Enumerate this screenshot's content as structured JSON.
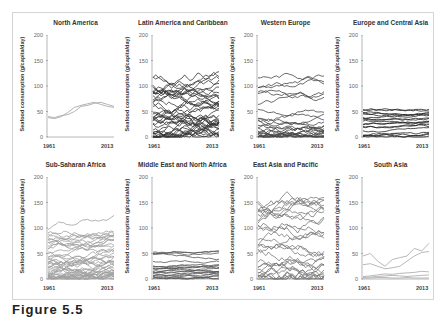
{
  "figure": {
    "caption": "Figure 5.5"
  },
  "chart_data": [
    {
      "type": "line",
      "title": "North America",
      "ylabel": "Seafood consumption (g/capita/day)",
      "xlabel": "",
      "x_ticks": [
        "1961",
        "2013"
      ],
      "y_ticks": [
        0,
        50,
        100,
        150,
        200
      ],
      "ylim": [
        0,
        200
      ],
      "color": "#aaaaaa",
      "series": [
        {
          "name": "country-1",
          "values": [
            38,
            36,
            40,
            48,
            58,
            62,
            65,
            68,
            64,
            60,
            58
          ]
        },
        {
          "name": "country-2",
          "values": [
            40,
            38,
            42,
            44,
            50,
            60,
            62,
            66,
            68,
            64,
            60
          ]
        }
      ]
    },
    {
      "type": "line",
      "title": "Latin America and Caribbean",
      "ylabel": "Seafood consumption (g/capita/day)",
      "xlabel": "",
      "x_ticks": [
        "1961",
        "2013"
      ],
      "y_ticks": [
        0,
        50,
        100,
        150,
        200
      ],
      "ylim": [
        0,
        200
      ],
      "color": "#333333",
      "series_summary": "~40 countries, range 0-160, peaks near 160 in 1980s"
    },
    {
      "type": "line",
      "title": "Western Europe",
      "ylabel": "Seafood consumption (g/capita/day)",
      "xlabel": "",
      "x_ticks": [
        "1961",
        "2013"
      ],
      "y_ticks": [
        0,
        50,
        100,
        150,
        200
      ],
      "ylim": [
        0,
        200
      ],
      "color": "#444444",
      "series_summary": "~25 countries, range 15-195, Iceland-like series peaks ~195"
    },
    {
      "type": "line",
      "title": "Europe and Central Asia",
      "ylabel": "Seafood consumption (g/capita/day)",
      "xlabel": "",
      "x_ticks": [
        "1961",
        "2013"
      ],
      "y_ticks": [
        0,
        50,
        100,
        150,
        200
      ],
      "ylim": [
        0,
        200
      ],
      "color": "#222222",
      "series_summary": "~20 countries, range 0-82"
    },
    {
      "type": "line",
      "title": "Sub-Saharan Africa",
      "ylabel": "Seafood consumption (g/capita/day)",
      "xlabel": "",
      "x_ticks": [
        "1961",
        "2013"
      ],
      "y_ticks": [
        0,
        50,
        100,
        150,
        200
      ],
      "ylim": [
        0,
        200
      ],
      "color": "#a0a0a0",
      "series_summary": "~45 countries, range 0-138"
    },
    {
      "type": "line",
      "title": "Middle East and North Africa",
      "ylabel": "Seafood consumption (g/capita/day)",
      "xlabel": "",
      "x_ticks": [
        "1961",
        "2013"
      ],
      "y_ticks": [
        0,
        50,
        100,
        150,
        200
      ],
      "ylim": [
        0,
        200
      ],
      "color": "#555555",
      "series_summary": "~20 countries, range 0-80"
    },
    {
      "type": "line",
      "title": "East Asia and Pacific",
      "ylabel": "Seafood consumption (g/capita/day)",
      "xlabel": "",
      "x_ticks": [
        "1961",
        "2013"
      ],
      "y_ticks": [
        0,
        50,
        100,
        150,
        200
      ],
      "ylim": [
        0,
        200
      ],
      "color": "#777777",
      "series_summary": "~30 countries, range 0-198"
    },
    {
      "type": "line",
      "title": "South Asia",
      "ylabel": "Seafood consumption (g/capita/day)",
      "xlabel": "",
      "x_ticks": [
        "1961",
        "2013"
      ],
      "y_ticks": [
        0,
        50,
        100,
        150,
        200
      ],
      "ylim": [
        0,
        200
      ],
      "color": "#b0b0b0",
      "series": [
        {
          "name": "country-1",
          "values": [
            45,
            50,
            35,
            25,
            38,
            42,
            45,
            60,
            55,
            70
          ]
        },
        {
          "name": "country-2",
          "values": [
            28,
            30,
            25,
            20,
            22,
            25,
            35,
            45,
            52,
            54
          ]
        },
        {
          "name": "country-3",
          "values": [
            5,
            6,
            8,
            10,
            9,
            11,
            12,
            13,
            15,
            14
          ]
        },
        {
          "name": "country-4",
          "values": [
            3,
            4,
            5,
            6,
            7,
            6,
            5,
            6,
            7,
            8
          ]
        },
        {
          "name": "country-5",
          "values": [
            2,
            2,
            3,
            3,
            2,
            2,
            3,
            2,
            2,
            2
          ]
        }
      ]
    }
  ]
}
